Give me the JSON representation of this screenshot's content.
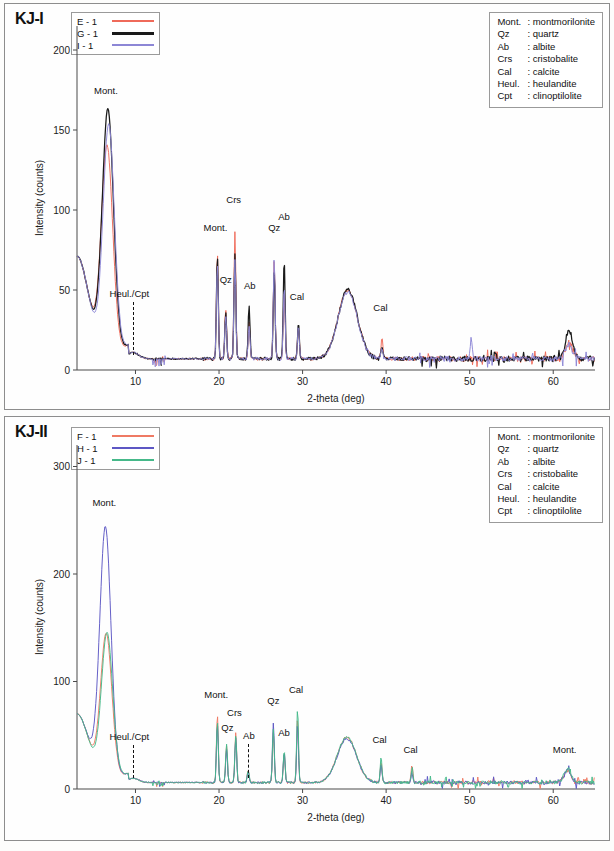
{
  "figure": {
    "panels": [
      {
        "title": "KJ-I",
        "series_legend": [
          {
            "name": "E - 1",
            "color": "#ef6a5a"
          },
          {
            "name": "G - 1",
            "color": "#1a1a1a"
          },
          {
            "name": "I - 1",
            "color": "#8d87d6"
          }
        ],
        "mineral_legend": [
          {
            "abbr": "Mont.",
            "sep": ":",
            "name": "montmorilonite"
          },
          {
            "abbr": "Qz",
            "sep": ":",
            "name": "quartz"
          },
          {
            "abbr": "Ab",
            "sep": ":",
            "name": "albite"
          },
          {
            "abbr": "Crs",
            "sep": ":",
            "name": "cristobalite"
          },
          {
            "abbr": "Cal",
            "sep": ":",
            "name": "calcite"
          },
          {
            "abbr": "Heul.",
            "sep": ":",
            "name": "heulandite"
          },
          {
            "abbr": "Cpt",
            "sep": ":",
            "name": "clinoptilolite"
          }
        ],
        "xlabel": "2-theta (deg)",
        "ylabel": "Intensity (counts)",
        "xticks": [
          10,
          20,
          30,
          40,
          50,
          60
        ],
        "yticks": [
          0,
          50,
          100,
          150,
          200
        ],
        "peak_labels": [
          {
            "text": "Mont.",
            "x": 6.6,
            "y": 172
          },
          {
            "text": "Heul./Cpt",
            "x": 9.7,
            "y": 45,
            "dashed": true
          },
          {
            "text": "Mont.",
            "x": 19.7,
            "y": 86
          },
          {
            "text": "Qz",
            "x": 20.7,
            "y": 54
          },
          {
            "text": "Crs",
            "x": 21.8,
            "y": 104
          },
          {
            "text": "Ab",
            "x": 23.6,
            "y": 50
          },
          {
            "text": "Qz",
            "x": 26.5,
            "y": 86
          },
          {
            "text": "Ab",
            "x": 27.7,
            "y": 93
          },
          {
            "text": "Cal",
            "x": 29.4,
            "y": 43
          },
          {
            "text": "Cal",
            "x": 39.4,
            "y": 36
          }
        ]
      },
      {
        "title": "KJ-II",
        "series_legend": [
          {
            "name": "F - 1",
            "color": "#ef7a64"
          },
          {
            "name": "H - 1",
            "color": "#5d57c4"
          },
          {
            "name": "J - 1",
            "color": "#46b98a"
          }
        ],
        "mineral_legend": [
          {
            "abbr": "Mont.",
            "sep": ":",
            "name": "montmorilonite"
          },
          {
            "abbr": "Qz",
            "sep": ":",
            "name": "quartz"
          },
          {
            "abbr": "Ab",
            "sep": ":",
            "name": "albite"
          },
          {
            "abbr": "Crs",
            "sep": ":",
            "name": "cristobalite"
          },
          {
            "abbr": "Cal",
            "sep": ":",
            "name": "calcite"
          },
          {
            "abbr": "Heul.",
            "sep": ":",
            "name": "heulandite"
          },
          {
            "abbr": "Cpt",
            "sep": ":",
            "name": "clinoptilolite"
          }
        ],
        "xlabel": "2-theta (deg)",
        "ylabel": "Intensity (counts)",
        "xticks": [
          10,
          20,
          30,
          40,
          50,
          60
        ],
        "yticks": [
          0,
          100,
          200,
          300
        ],
        "peak_labels": [
          {
            "text": "Mont.",
            "x": 6.4,
            "y": 262
          },
          {
            "text": "Heul./Cpt",
            "x": 9.7,
            "y": 45,
            "dashed": true
          },
          {
            "text": "Mont.",
            "x": 19.8,
            "y": 84
          },
          {
            "text": "Qz",
            "x": 20.9,
            "y": 53
          },
          {
            "text": "Crs",
            "x": 21.9,
            "y": 67
          },
          {
            "text": "Ab",
            "x": 23.5,
            "y": 46,
            "dashed": true
          },
          {
            "text": "Qz",
            "x": 26.4,
            "y": 78
          },
          {
            "text": "Ab",
            "x": 27.7,
            "y": 48
          },
          {
            "text": "Cal",
            "x": 29.3,
            "y": 88
          },
          {
            "text": "Cal",
            "x": 39.3,
            "y": 42
          },
          {
            "text": "Cal",
            "x": 43.0,
            "y": 33
          },
          {
            "text": "Mont.",
            "x": 61.5,
            "y": 33
          }
        ]
      }
    ]
  },
  "chart_data": [
    {
      "type": "line",
      "title": "KJ-I",
      "xlabel": "2-theta (deg)",
      "ylabel": "Intensity (counts)",
      "xlim": [
        3,
        65
      ],
      "ylim": [
        0,
        215
      ],
      "xticks": [
        10,
        20,
        30,
        40,
        50,
        60
      ],
      "yticks": [
        0,
        50,
        100,
        150,
        200
      ],
      "grid": false,
      "legend_position": "top-left",
      "series": [
        {
          "name": "E - 1",
          "color": "#ef6a5a",
          "peaks": [
            {
              "x": 6.6,
              "y": 133,
              "mineral": "Mont."
            },
            {
              "x": 9.7,
              "y": 11,
              "mineral": "Heul./Cpt"
            },
            {
              "x": 19.8,
              "y": 74,
              "mineral": "Mont."
            },
            {
              "x": 20.8,
              "y": 38,
              "mineral": "Qz"
            },
            {
              "x": 21.9,
              "y": 87,
              "mineral": "Crs"
            },
            {
              "x": 23.6,
              "y": 31,
              "mineral": "Ab"
            },
            {
              "x": 26.6,
              "y": 68,
              "mineral": "Qz"
            },
            {
              "x": 27.8,
              "y": 50,
              "mineral": "Ab"
            },
            {
              "x": 29.5,
              "y": 27,
              "mineral": "Cal"
            },
            {
              "x": 35.5,
              "y": 30
            },
            {
              "x": 39.5,
              "y": 20,
              "mineral": "Cal"
            },
            {
              "x": 61.9,
              "y": 18
            }
          ],
          "baseline": 7
        },
        {
          "name": "G - 1",
          "color": "#1a1a1a",
          "peaks": [
            {
              "x": 6.7,
              "y": 156,
              "mineral": "Mont."
            },
            {
              "x": 9.7,
              "y": 11,
              "mineral": "Heul./Cpt"
            },
            {
              "x": 19.8,
              "y": 72,
              "mineral": "Mont."
            },
            {
              "x": 20.8,
              "y": 36,
              "mineral": "Qz"
            },
            {
              "x": 21.9,
              "y": 73,
              "mineral": "Crs"
            },
            {
              "x": 23.6,
              "y": 41,
              "mineral": "Ab"
            },
            {
              "x": 26.6,
              "y": 62,
              "mineral": "Qz"
            },
            {
              "x": 27.8,
              "y": 69,
              "mineral": "Ab"
            },
            {
              "x": 29.5,
              "y": 29,
              "mineral": "Cal"
            },
            {
              "x": 35.5,
              "y": 30
            },
            {
              "x": 39.5,
              "y": 14,
              "mineral": "Cal"
            },
            {
              "x": 61.9,
              "y": 25
            }
          ],
          "baseline": 7
        },
        {
          "name": "I - 1",
          "color": "#8d87d6",
          "peaks": [
            {
              "x": 6.8,
              "y": 147,
              "mineral": "Mont."
            },
            {
              "x": 9.7,
              "y": 11,
              "mineral": "Heul./Cpt"
            },
            {
              "x": 19.8,
              "y": 68,
              "mineral": "Mont."
            },
            {
              "x": 20.8,
              "y": 34,
              "mineral": "Qz"
            },
            {
              "x": 21.9,
              "y": 70,
              "mineral": "Crs"
            },
            {
              "x": 23.6,
              "y": 28,
              "mineral": "Ab"
            },
            {
              "x": 26.6,
              "y": 70,
              "mineral": "Qz"
            },
            {
              "x": 27.8,
              "y": 52,
              "mineral": "Ab"
            },
            {
              "x": 29.5,
              "y": 27,
              "mineral": "Cal"
            },
            {
              "x": 35.5,
              "y": 29
            },
            {
              "x": 39.5,
              "y": 13,
              "mineral": "Cal"
            },
            {
              "x": 50.2,
              "y": 20
            },
            {
              "x": 61.9,
              "y": 16
            }
          ],
          "baseline": 7
        }
      ],
      "annotations": [
        "Mont.",
        "Heul./Cpt",
        "Mont.",
        "Qz",
        "Crs",
        "Ab",
        "Qz",
        "Ab",
        "Cal",
        "Cal"
      ]
    },
    {
      "type": "line",
      "title": "KJ-II",
      "xlabel": "2-theta (deg)",
      "ylabel": "Intensity (counts)",
      "xlim": [
        3,
        65
      ],
      "ylim": [
        0,
        320
      ],
      "xticks": [
        10,
        20,
        30,
        40,
        50,
        60
      ],
      "yticks": [
        0,
        100,
        200,
        300
      ],
      "grid": false,
      "legend_position": "top-left",
      "series": [
        {
          "name": "F - 1",
          "color": "#ef7a64",
          "peaks": [
            {
              "x": 6.5,
              "y": 137,
              "mineral": "Mont."
            },
            {
              "x": 9.7,
              "y": 10,
              "mineral": "Heul./Cpt"
            },
            {
              "x": 19.8,
              "y": 70,
              "mineral": "Mont."
            },
            {
              "x": 20.9,
              "y": 40,
              "mineral": "Qz"
            },
            {
              "x": 22.0,
              "y": 52,
              "mineral": "Crs"
            },
            {
              "x": 23.5,
              "y": 18,
              "mineral": "Ab"
            },
            {
              "x": 26.5,
              "y": 52,
              "mineral": "Qz"
            },
            {
              "x": 27.8,
              "y": 33,
              "mineral": "Ab"
            },
            {
              "x": 29.4,
              "y": 66,
              "mineral": "Cal"
            },
            {
              "x": 35.3,
              "y": 28
            },
            {
              "x": 39.4,
              "y": 26,
              "mineral": "Cal"
            },
            {
              "x": 43.1,
              "y": 22,
              "mineral": "Cal"
            },
            {
              "x": 61.7,
              "y": 17,
              "mineral": "Mont."
            }
          ],
          "baseline": 6
        },
        {
          "name": "H - 1",
          "color": "#5d57c4",
          "peaks": [
            {
              "x": 6.4,
              "y": 236,
              "mineral": "Mont."
            },
            {
              "x": 9.7,
              "y": 10,
              "mineral": "Heul./Cpt"
            },
            {
              "x": 19.8,
              "y": 61,
              "mineral": "Mont."
            },
            {
              "x": 20.9,
              "y": 37,
              "mineral": "Qz"
            },
            {
              "x": 22.0,
              "y": 48,
              "mineral": "Crs"
            },
            {
              "x": 23.5,
              "y": 17,
              "mineral": "Ab"
            },
            {
              "x": 26.5,
              "y": 62,
              "mineral": "Qz"
            },
            {
              "x": 27.8,
              "y": 34,
              "mineral": "Ab"
            },
            {
              "x": 29.4,
              "y": 60,
              "mineral": "Cal"
            },
            {
              "x": 35.3,
              "y": 27
            },
            {
              "x": 39.4,
              "y": 23,
              "mineral": "Cal"
            },
            {
              "x": 43.1,
              "y": 15,
              "mineral": "Cal"
            },
            {
              "x": 61.7,
              "y": 17,
              "mineral": "Mont."
            }
          ],
          "baseline": 6
        },
        {
          "name": "J - 1",
          "color": "#46b98a",
          "peaks": [
            {
              "x": 6.6,
              "y": 138,
              "mineral": "Mont."
            },
            {
              "x": 9.7,
              "y": 10,
              "mineral": "Heul./Cpt"
            },
            {
              "x": 19.8,
              "y": 64,
              "mineral": "Mont."
            },
            {
              "x": 20.9,
              "y": 42,
              "mineral": "Qz"
            },
            {
              "x": 22.0,
              "y": 50,
              "mineral": "Crs"
            },
            {
              "x": 23.5,
              "y": 18,
              "mineral": "Ab"
            },
            {
              "x": 26.5,
              "y": 55,
              "mineral": "Qz"
            },
            {
              "x": 27.8,
              "y": 35,
              "mineral": "Ab"
            },
            {
              "x": 29.4,
              "y": 74,
              "mineral": "Cal"
            },
            {
              "x": 35.3,
              "y": 28
            },
            {
              "x": 39.4,
              "y": 29,
              "mineral": "Cal"
            },
            {
              "x": 43.1,
              "y": 20,
              "mineral": "Cal"
            },
            {
              "x": 61.7,
              "y": 19,
              "mineral": "Mont."
            }
          ],
          "baseline": 6
        }
      ],
      "annotations": [
        "Mont.",
        "Heul./Cpt",
        "Mont.",
        "Qz",
        "Crs",
        "Ab",
        "Qz",
        "Ab",
        "Cal",
        "Cal",
        "Cal",
        "Mont."
      ]
    }
  ]
}
